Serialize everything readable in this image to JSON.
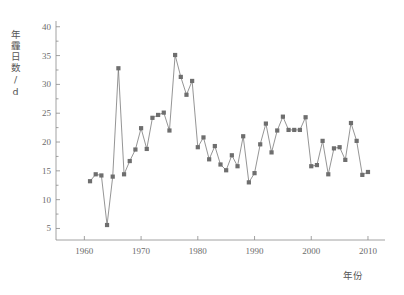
{
  "chart_data": {
    "type": "line",
    "title": "",
    "subtitle": "",
    "xlabel": "年份",
    "ylabel": "年霾日数/d",
    "xlim": [
      1955,
      2013
    ],
    "ylim": [
      3,
      41
    ],
    "xticks": [
      1960,
      1970,
      1980,
      1990,
      2000,
      2010
    ],
    "xtick_labels": [
      "1960",
      "1970",
      "1980",
      "1990",
      "2000",
      "2010"
    ],
    "yticks": [
      5,
      10,
      15,
      20,
      25,
      30,
      35,
      40
    ],
    "ytick_labels": [
      "5",
      "10",
      "15",
      "20",
      "25",
      "30",
      "35",
      "40"
    ],
    "minor_yticks": [
      7.5,
      12.5,
      17.5,
      22.5,
      27.5,
      32.5,
      37.5
    ],
    "grid": false,
    "legend": null,
    "marker": "square",
    "marker_color": "#6e6e6e",
    "line_color": "#7a7a7a",
    "x": [
      1961,
      1962,
      1963,
      1964,
      1965,
      1966,
      1967,
      1968,
      1969,
      1970,
      1971,
      1972,
      1973,
      1974,
      1975,
      1976,
      1977,
      1978,
      1979,
      1980,
      1981,
      1982,
      1983,
      1984,
      1985,
      1986,
      1987,
      1988,
      1989,
      1990,
      1991,
      1992,
      1993,
      1994,
      1995,
      1996,
      1997,
      1998,
      1999,
      2000,
      2001,
      2002,
      2003,
      2004,
      2005,
      2006,
      2007,
      2008,
      2009,
      2010
    ],
    "values": [
      13.2,
      14.4,
      14.2,
      5.6,
      14.0,
      32.8,
      14.4,
      16.7,
      18.7,
      22.4,
      18.8,
      24.2,
      24.7,
      25.1,
      22.0,
      35.1,
      31.3,
      28.2,
      30.6,
      19.1,
      20.8,
      17.0,
      19.3,
      16.1,
      15.1,
      17.7,
      15.8,
      21.0,
      13.0,
      14.6,
      19.6,
      23.2,
      18.2,
      22.0,
      24.4,
      22.1,
      22.1,
      22.1,
      24.3,
      15.8,
      16.0,
      20.2,
      14.4,
      18.9,
      19.1,
      16.9,
      23.3,
      20.2,
      14.3,
      14.8
    ],
    "series": [
      {
        "name": "年霾日数",
        "values": [
          13.2,
          14.4,
          14.2,
          5.6,
          14.0,
          32.8,
          14.4,
          16.7,
          18.7,
          22.4,
          18.8,
          24.2,
          24.7,
          25.1,
          22.0,
          35.1,
          31.3,
          28.2,
          30.6,
          19.1,
          20.8,
          17.0,
          19.3,
          16.1,
          15.1,
          17.7,
          15.8,
          21.0,
          13.0,
          14.6,
          19.6,
          23.2,
          18.2,
          22.0,
          24.4,
          22.1,
          22.1,
          22.1,
          24.3,
          15.8,
          16.0,
          20.2,
          14.4,
          18.9,
          19.1,
          16.9,
          23.3,
          20.2,
          14.3,
          14.8
        ]
      }
    ]
  },
  "colors": {
    "background": "#ffffff",
    "axis": "#8c8c8c",
    "text": "#6b6b6b",
    "marker": "#6e6e6e",
    "line": "#7a7a7a"
  }
}
